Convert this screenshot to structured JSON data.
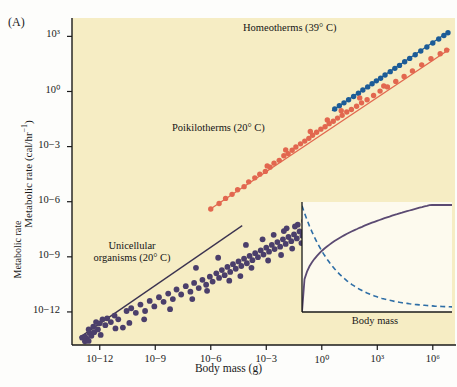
{
  "figure": {
    "panel_label": "(A)",
    "background_color": "#f6edc4",
    "page_background": "#fdfdfb"
  },
  "axes": {
    "xlabel": "Body mass (g)",
    "ylabel": "Metabolic rate (cal/hr–1)",
    "ylabel_base": "Metabolic rate (cal/hr",
    "ylabel_exp": "−1",
    "ylabel_close": ")",
    "x_ticks": [
      "10−12",
      "10−9",
      "10−6",
      "10−3",
      "10⁰",
      "10³",
      "10⁶"
    ],
    "y_ticks": [
      "10³",
      "10⁰",
      "10−3",
      "10−6",
      "10−9",
      "10−12"
    ],
    "x_tick_exponents": [
      -12,
      -9,
      -6,
      -3,
      0,
      3,
      6
    ],
    "y_tick_exponents": [
      3,
      0,
      -3,
      -6,
      -9,
      -12
    ],
    "xlim": [
      -13.5,
      7.2
    ],
    "ylim": [
      -13.8,
      4.0
    ],
    "grid": false
  },
  "series_labels": {
    "homeotherms": "Homeotherms (39° C)",
    "poikilotherms": "Poikilotherms (20° C)",
    "unicellular_line1": "Unicellular",
    "unicellular_line2": "organisms (20° C)"
  },
  "colors": {
    "homeotherms": "#1c5c97",
    "poikilotherms": "#e2674f",
    "unicellular": "#4b3f6b",
    "inset_solid": "#5b4a72",
    "inset_dashed": "#2e6ea6",
    "plot_bg": "#f6edc4",
    "inset_bg": "#fdfaee",
    "axis": "#1a1a1a"
  },
  "chart_data": {
    "type": "scatter",
    "title": "",
    "xlabel": "Body mass (g)",
    "ylabel": "Metabolic rate (cal/hr−1)",
    "xlabel_note": "log10 body mass in grams",
    "ylabel_note": "log10 metabolic rate in cal/hr",
    "xlim": [
      -13.5,
      7.2
    ],
    "ylim": [
      -13.8,
      4.0
    ],
    "grid": false,
    "legend_position": "inline-annotations",
    "series": [
      {
        "name": "Homeotherms (39° C)",
        "color": "#1c5c97",
        "marker": "circle",
        "trend_line": {
          "x": [
            0.55,
            6.85
          ],
          "y": [
            -1.05,
            3.25
          ],
          "slope": 0.68
        },
        "points": [
          [
            0.7,
            -0.95
          ],
          [
            0.95,
            -0.78
          ],
          [
            1.2,
            -0.62
          ],
          [
            1.45,
            -0.45
          ],
          [
            1.72,
            -0.27
          ],
          [
            1.98,
            -0.1
          ],
          [
            2.22,
            0.08
          ],
          [
            2.48,
            0.25
          ],
          [
            2.72,
            0.42
          ],
          [
            2.95,
            0.58
          ],
          [
            3.18,
            0.72
          ],
          [
            3.42,
            0.9
          ],
          [
            3.7,
            1.08
          ],
          [
            3.95,
            1.26
          ],
          [
            4.2,
            1.42
          ],
          [
            4.48,
            1.62
          ],
          [
            4.75,
            1.8
          ],
          [
            5.05,
            2.0
          ],
          [
            5.35,
            2.2
          ],
          [
            5.68,
            2.42
          ],
          [
            6.0,
            2.64
          ],
          [
            6.32,
            2.86
          ],
          [
            6.6,
            3.05
          ],
          [
            6.82,
            3.2
          ]
        ]
      },
      {
        "name": "Poikilotherms (20° C)",
        "color": "#e2674f",
        "marker": "circle",
        "trend_line": {
          "x": [
            -6.1,
            6.9
          ],
          "y": [
            -6.45,
            2.3
          ],
          "slope": 0.675
        },
        "points": [
          [
            -6.0,
            -6.4
          ],
          [
            -5.55,
            -6.1
          ],
          [
            -5.2,
            -5.82
          ],
          [
            -4.85,
            -5.6
          ],
          [
            -4.55,
            -5.35
          ],
          [
            -4.2,
            -5.18
          ],
          [
            -3.95,
            -4.92
          ],
          [
            -3.62,
            -4.7
          ],
          [
            -3.35,
            -4.5
          ],
          [
            -3.05,
            -4.35
          ],
          [
            -2.8,
            -4.12
          ],
          [
            -2.58,
            -3.9
          ],
          [
            -2.3,
            -3.75
          ],
          [
            -2.05,
            -3.5
          ],
          [
            -1.82,
            -3.38
          ],
          [
            -1.6,
            -3.2
          ],
          [
            -1.4,
            -3.02
          ],
          [
            -1.15,
            -2.85
          ],
          [
            -0.92,
            -2.7
          ],
          [
            -0.7,
            -2.55
          ],
          [
            -0.5,
            -2.38
          ],
          [
            -0.28,
            -2.22
          ],
          [
            -0.05,
            -2.05
          ],
          [
            0.18,
            -1.92
          ],
          [
            0.4,
            -1.75
          ],
          [
            0.62,
            -1.62
          ],
          [
            0.85,
            -1.45
          ],
          [
            1.1,
            -1.3
          ],
          [
            1.35,
            -1.12
          ],
          [
            1.6,
            -0.98
          ],
          [
            1.88,
            -0.8
          ],
          [
            2.15,
            -0.62
          ],
          [
            2.45,
            -0.45
          ],
          [
            2.8,
            -0.22
          ],
          [
            3.15,
            0.02
          ],
          [
            3.55,
            0.25
          ],
          [
            4.0,
            0.55
          ],
          [
            4.45,
            0.82
          ],
          [
            4.9,
            1.12
          ],
          [
            5.4,
            1.45
          ],
          [
            5.9,
            1.78
          ],
          [
            6.4,
            2.05
          ],
          [
            6.75,
            2.25
          ],
          [
            -2.95,
            -4.05
          ],
          [
            -1.95,
            -3.18
          ],
          [
            -0.62,
            -2.18
          ],
          [
            0.3,
            -1.55
          ],
          [
            1.05,
            -1.05
          ],
          [
            2.05,
            -0.35
          ],
          [
            3.35,
            0.3
          ]
        ]
      },
      {
        "name": "Unicellular organisms (20° C)",
        "color": "#4b3f6b",
        "marker": "circle",
        "trend_line": {
          "x": [
            -13.1,
            -4.3
          ],
          "y": [
            -13.4,
            -7.3
          ],
          "slope": 0.695
        },
        "points": [
          [
            -12.95,
            -13.4
          ],
          [
            -12.8,
            -13.35
          ],
          [
            -12.7,
            -13.45
          ],
          [
            -12.55,
            -13.15
          ],
          [
            -12.6,
            -12.95
          ],
          [
            -12.45,
            -13.3
          ],
          [
            -12.35,
            -12.8
          ],
          [
            -12.3,
            -13.1
          ],
          [
            -12.2,
            -12.55
          ],
          [
            -12.1,
            -12.95
          ],
          [
            -12.0,
            -12.62
          ],
          [
            -11.85,
            -12.4
          ],
          [
            -11.7,
            -12.72
          ],
          [
            -11.6,
            -12.35
          ],
          [
            -11.4,
            -12.55
          ],
          [
            -11.2,
            -12.2
          ],
          [
            -11.0,
            -12.4
          ],
          [
            -10.75,
            -12.85
          ],
          [
            -10.55,
            -11.95
          ],
          [
            -10.3,
            -11.8
          ],
          [
            -10.05,
            -12.05
          ],
          [
            -9.8,
            -11.6
          ],
          [
            -9.55,
            -11.95
          ],
          [
            -9.3,
            -11.4
          ],
          [
            -9.05,
            -11.7
          ],
          [
            -8.8,
            -11.2
          ],
          [
            -8.55,
            -11.45
          ],
          [
            -8.3,
            -11.0
          ],
          [
            -8.05,
            -11.3
          ],
          [
            -7.85,
            -10.78
          ],
          [
            -7.6,
            -11.05
          ],
          [
            -7.35,
            -10.6
          ],
          [
            -7.1,
            -10.9
          ],
          [
            -6.9,
            -10.42
          ],
          [
            -6.65,
            -10.7
          ],
          [
            -6.45,
            -10.25
          ],
          [
            -6.25,
            -10.52
          ],
          [
            -6.05,
            -10.08
          ],
          [
            -5.9,
            -10.35
          ],
          [
            -5.7,
            -9.9
          ],
          [
            -5.55,
            -10.15
          ],
          [
            -5.4,
            -9.72
          ],
          [
            -5.25,
            -10.0
          ],
          [
            -5.1,
            -9.55
          ],
          [
            -4.95,
            -9.82
          ],
          [
            -4.8,
            -9.4
          ],
          [
            -4.65,
            -9.65
          ],
          [
            -4.5,
            -9.25
          ],
          [
            -4.35,
            -9.5
          ],
          [
            -4.2,
            -9.1
          ],
          [
            -4.05,
            -9.35
          ],
          [
            -3.9,
            -8.95
          ],
          [
            -3.75,
            -9.18
          ],
          [
            -3.6,
            -8.8
          ],
          [
            -3.45,
            -9.02
          ],
          [
            -3.3,
            -8.65
          ],
          [
            -3.15,
            -8.88
          ],
          [
            -3.0,
            -8.5
          ],
          [
            -2.85,
            -8.72
          ],
          [
            -2.7,
            -8.35
          ],
          [
            -2.55,
            -8.58
          ],
          [
            -2.4,
            -8.2
          ],
          [
            -2.25,
            -8.45
          ],
          [
            -2.1,
            -8.05
          ],
          [
            -1.95,
            -8.3
          ],
          [
            -1.8,
            -7.92
          ],
          [
            -1.65,
            -8.15
          ],
          [
            -1.5,
            -7.78
          ],
          [
            -1.35,
            -8.0
          ],
          [
            -1.2,
            -7.62
          ],
          [
            -1.05,
            -7.85
          ],
          [
            -0.9,
            -7.5
          ],
          [
            -9.6,
            -12.4
          ],
          [
            -8.2,
            -11.85
          ],
          [
            -7.0,
            -11.3
          ],
          [
            -6.2,
            -10.85
          ],
          [
            -5.0,
            -10.3
          ],
          [
            -4.4,
            -10.05
          ],
          [
            -3.8,
            -9.6
          ],
          [
            -2.9,
            -9.2
          ],
          [
            -2.2,
            -8.9
          ],
          [
            -1.6,
            -8.55
          ],
          [
            -1.1,
            -8.25
          ],
          [
            -0.75,
            -8.0
          ],
          [
            -6.8,
            -9.6
          ],
          [
            -5.6,
            -9.05
          ],
          [
            -4.1,
            -8.35
          ],
          [
            -3.2,
            -8.05
          ],
          [
            -2.6,
            -7.8
          ],
          [
            -1.9,
            -7.45
          ],
          [
            -1.3,
            -7.25
          ],
          [
            -0.95,
            -7.05
          ],
          [
            -11.95,
            -13.25
          ],
          [
            -11.15,
            -12.9
          ],
          [
            -10.4,
            -12.6
          ],
          [
            -12.8,
            -13.6
          ],
          [
            -12.6,
            -13.58
          ],
          [
            -1.45,
            -7.35
          ],
          [
            -2.05,
            -7.6
          ],
          [
            -0.85,
            -7.3
          ]
        ]
      }
    ]
  },
  "inset": {
    "xlabel": "Body mass",
    "ylabel": "Metabolic rate",
    "type": "line",
    "curves": [
      {
        "name": "total-metabolic-rate",
        "style": "solid",
        "color": "#5b4a72",
        "description": "rises steeply then saturates"
      },
      {
        "name": "mass-specific-metabolic-rate",
        "style": "dashed",
        "color": "#2e6ea6",
        "description": "declines steeply then flattens"
      }
    ]
  }
}
